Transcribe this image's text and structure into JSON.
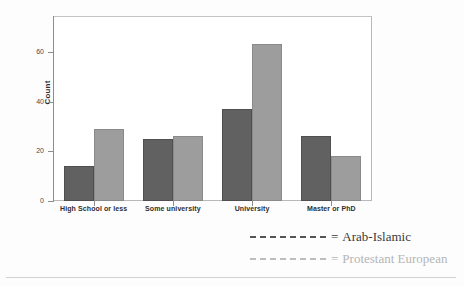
{
  "chart_data": {
    "type": "bar",
    "title": "",
    "xlabel": "",
    "ylabel": "Count",
    "categories": [
      "High School or less",
      "Some university",
      "University",
      "Master or PhD"
    ],
    "series": [
      {
        "name": "Arab-Islamic",
        "color": "#616161",
        "values": [
          14,
          25,
          37,
          26
        ]
      },
      {
        "name": "Protestant European",
        "color": "#9d9d9d",
        "values": [
          29,
          26,
          63,
          18
        ]
      }
    ],
    "ylim": [
      0,
      74
    ],
    "yticks": [
      0,
      20,
      40,
      60
    ],
    "ytick_labels": [
      "0",
      "20",
      "40",
      "60"
    ],
    "grid": false,
    "legend_position": "below-right",
    "legend_separator": "=",
    "legend_marker": "dashed-line"
  },
  "axes": {
    "y_title": "Count"
  },
  "legend": {
    "entries": [
      {
        "equals": "=",
        "label": "Arab-Islamic"
      },
      {
        "equals": "=",
        "label": "Protestant European"
      }
    ]
  }
}
